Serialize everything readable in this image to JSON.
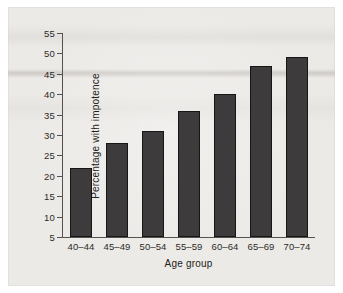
{
  "chart_data": {
    "type": "bar",
    "title": "",
    "xlabel": "Age group",
    "ylabel": "Percentage with impotence",
    "categories": [
      "40–44",
      "45–49",
      "50–54",
      "55–59",
      "60–64",
      "65–69",
      "70–74"
    ],
    "values": [
      22,
      28,
      31,
      36,
      40,
      47,
      49
    ],
    "yticks": [
      5,
      10,
      15,
      20,
      25,
      30,
      35,
      40,
      45,
      50,
      55
    ],
    "ylim": [
      0,
      55
    ],
    "grid": false,
    "legend": null,
    "bar_color": "#3e3b3c",
    "bar_edge_color": "#171617",
    "axis_color": "#55514e",
    "background_color": "#eceae7"
  },
  "figure": {
    "page_background": "#ffffff"
  }
}
